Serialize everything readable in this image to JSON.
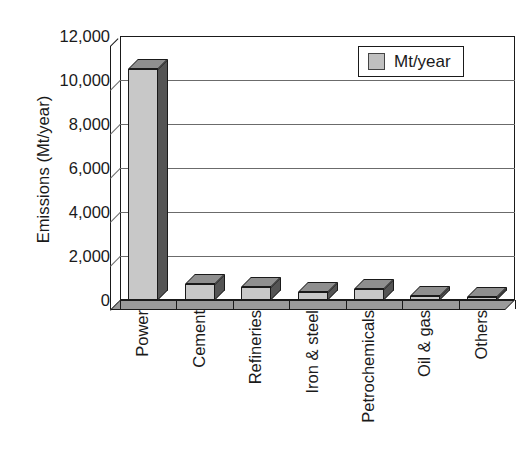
{
  "chart_data": {
    "type": "bar",
    "title": "",
    "subtitle": "",
    "xlabel": "",
    "ylabel": "Emissions (Mt/year)",
    "categories": [
      "Power",
      "Cement",
      "Refineries",
      "Iron & steel",
      "Petrochemicals",
      "Oil & gas",
      "Others"
    ],
    "series": [
      {
        "name": "Mt/year",
        "values": [
          10500,
          730,
          590,
          380,
          500,
          160,
          150
        ]
      }
    ],
    "values": [
      10500,
      730,
      590,
      380,
      500,
      160,
      150
    ],
    "ylim": [
      0,
      12000
    ],
    "y_ticks": [
      0,
      2000,
      4000,
      6000,
      8000,
      10000,
      12000
    ],
    "y_tick_labels": [
      "0",
      "2,000",
      "4,000",
      "6,000",
      "8,000",
      "10,000",
      "12,000"
    ],
    "grid": true,
    "grid_axis": "y",
    "legend_position": "upper right",
    "legend_entries": [
      "Mt/year"
    ],
    "style": "3d-bar",
    "bar_color": "#c8c8c8",
    "bar_side_color": "#555555",
    "bar_top_color": "#8f8f8f",
    "axis_color": "#1a1a1a",
    "gridline_color": "#6b6b6b",
    "background_color": "#ffffff"
  },
  "legend": {
    "label": "Mt/year",
    "swatch_color": "#c0c0c0"
  },
  "axes": {
    "y_title": "Emissions (Mt/year)"
  }
}
